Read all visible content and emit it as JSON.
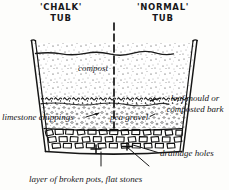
{
  "diagram": {
    "title_left": "'CHALK'\nTUB",
    "title_left_line1": "'CHALK'",
    "title_left_line2": "TUB",
    "title_right_line1": "'NORMAL'",
    "title_right_line2": "TUB",
    "labels": {
      "compost": "compost",
      "leaf_mould": "leaf mould or composted bark",
      "limestone_chippings": "limestone chippings",
      "pea_gravel": "pea gravel",
      "drainage_holes": "drainage holes",
      "broken_pots": "layer of broken pots, flat stones"
    },
    "colors": {
      "ink": "#17171a",
      "paper": "#fdfdfb",
      "stipple": "#3a3a3a"
    }
  }
}
